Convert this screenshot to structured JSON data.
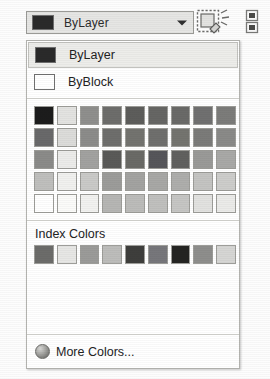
{
  "toolbar": {
    "combo": {
      "value": "ByLayer",
      "swatch_color": "#2a2a2a",
      "arrow_icon": "chevron-down-icon"
    },
    "icons": [
      {
        "name": "match-properties-icon",
        "title": "Match Properties"
      },
      {
        "name": "layer-previous-icon",
        "title": "Layer"
      }
    ]
  },
  "dropdown": {
    "options": [
      {
        "label": "ByLayer",
        "swatch": "#2a2a2a",
        "selected": true
      },
      {
        "label": "ByBlock",
        "swatch": "#ffffff",
        "selected": false
      }
    ],
    "standard_grid": {
      "rows": [
        [
          "#1c1c1c",
          "#e3e3e1",
          "#8f8f8d",
          "#6d6d6b",
          "#5d5d5b",
          "#666664",
          "#6a6a68",
          "#707070",
          "#7c7c7a"
        ],
        [
          "#69696a",
          "#dcdcda",
          "#8c8c8a",
          "#6e6e6c",
          "#73736f",
          "#6f6f6d",
          "#74746f",
          "#7b7b79",
          "#8a8a88"
        ],
        [
          "#8b8b89",
          "#ececea",
          "#a2a2a0",
          "#5a5a58",
          "#6a6a66",
          "#56565a",
          "#61615f",
          "#9a9a98",
          "#a9a9a7"
        ],
        [
          "#bfbfbd",
          "#f1f1ef",
          "#cacac8",
          "#9c9c9a",
          "#a3a3a1",
          "#a8a8a6",
          "#aeaeac",
          "#c4c4c2",
          "#cdcdcb"
        ],
        [
          "#ffffff",
          "#fbfbf9",
          "#f2f2f0",
          "#b6b6b4",
          "#bcbcba",
          "#c0c0be",
          "#c6c6c4",
          "#e2e2e0",
          "#ebebe9"
        ]
      ]
    },
    "index_section": {
      "title": "Index Colors",
      "swatches": [
        "#6c6c6a",
        "#e7e7e5",
        "#9b9b99",
        "#bdbdbb",
        "#3e3e3c",
        "#77777b",
        "#242422",
        "#8e8e8c",
        "#d6d6d4"
      ]
    },
    "footer": {
      "label": "More Colors...",
      "icon": "color-wheel-icon"
    }
  }
}
